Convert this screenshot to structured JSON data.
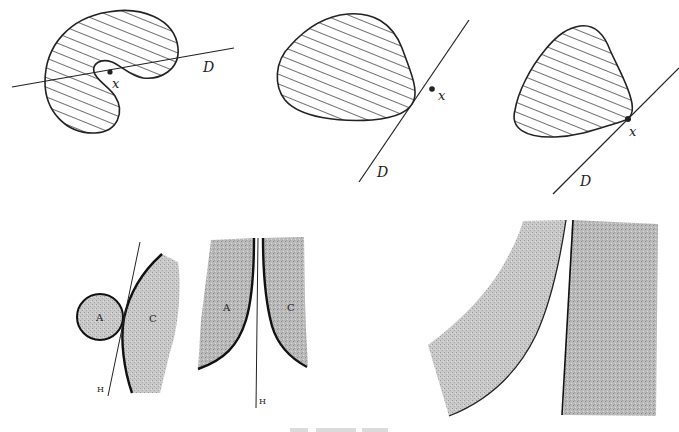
{
  "figures": {
    "top_left": {
      "point_label": "x",
      "line_label": "D",
      "shape": "non-convex hatched region"
    },
    "top_middle": {
      "point_label": "x",
      "line_label": "D",
      "shape": "convex hatched region, line not touching"
    },
    "top_right": {
      "point_label": "x",
      "line_label": "D",
      "shape": "convex hatched region, tangent line at x"
    },
    "bottom_left": {
      "set_a_label": "A",
      "set_c_label": "C",
      "line_label": "H"
    },
    "bottom_middle": {
      "set_a_label": "A",
      "set_c_label": "C",
      "line_label": "H"
    },
    "bottom_right": {
      "shape": "two shaded regions separated by a line"
    }
  },
  "colors": {
    "ink": "#222222",
    "shade": "#bdbdbd",
    "background": "#ffffff"
  }
}
